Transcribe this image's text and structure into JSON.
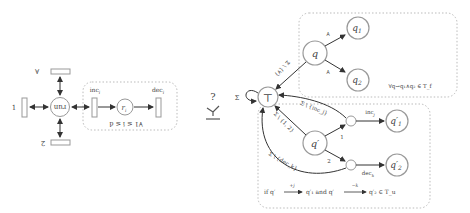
{
  "left_net": {
    "center_place": "run",
    "top_transition_label": "∀",
    "left_transition_label": "1",
    "bottom_transition_label": "2",
    "inner_place": "r",
    "inner_place_sub": "i",
    "inc_label": "inc",
    "inc_sub": "i",
    "dec_label": "dec",
    "dec_sub": "i",
    "group_condition": "∀1 ≤ i ≤ d"
  },
  "separator": {
    "question": "?",
    "symbol": "≻"
  },
  "automaton": {
    "top_state": "⊤",
    "self_loop_label": "Σ",
    "upper_group": {
      "state_q": "q",
      "state_q1": "q",
      "state_q1_sub": "1",
      "state_q2": "q",
      "state_q2_sub": "2",
      "edge_q_q1": "∀",
      "edge_q_q2": "∀",
      "edge_q_top": "Σ \\ {∀}",
      "condition": "∀q→q₁∧q₂ ∈ T_f"
    },
    "lower_group": {
      "state_qp": "q′",
      "state_q1p": "q′",
      "state_q1p_sub": "1",
      "state_q2p": "q′",
      "state_q2p_sub": "2",
      "edge_qp_mid1": "1",
      "edge_qp_mid2": "2",
      "edge_mid1_q1p": "inc",
      "edge_mid1_q1p_sub": "j",
      "edge_mid2_q2p": "dec",
      "edge_mid2_q2p_sub": "k",
      "edge_qp_top": "Σ \\ {1, 2}",
      "edge_mid1_top": "Σ \\ {inc_j}",
      "edge_mid2_top": "Σ \\ {dec_k}",
      "condition_prefix": "if q′",
      "cond_arrow1": "+j",
      "cond_mid1": "q′₁  and  q′",
      "cond_arrow2": "−k",
      "cond_end": "q′₂ ∈ T_u"
    }
  }
}
